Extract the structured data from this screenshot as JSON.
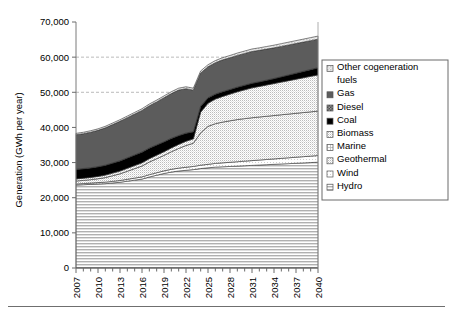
{
  "chart_data": {
    "type": "area",
    "stacked": true,
    "title": "",
    "xlabel": "",
    "ylabel": "Generation (GWh per year)",
    "ylim": [
      0,
      70000
    ],
    "ytick_labels": [
      "0",
      "10,000",
      "20,000",
      "30,000",
      "40,000",
      "50,000",
      "60,000",
      "70,000"
    ],
    "ytick_values": [
      0,
      10000,
      20000,
      30000,
      40000,
      50000,
      60000,
      70000
    ],
    "grid": "horizontal-dashed",
    "legend_position": "right",
    "x": [
      2007,
      2008,
      2009,
      2010,
      2011,
      2012,
      2013,
      2014,
      2015,
      2016,
      2017,
      2018,
      2019,
      2020,
      2021,
      2022,
      2023,
      2024,
      2025,
      2026,
      2027,
      2028,
      2029,
      2030,
      2031,
      2032,
      2033,
      2034,
      2035,
      2036,
      2037,
      2038,
      2039,
      2040
    ],
    "xtick_labels": [
      "2007",
      "2010",
      "2013",
      "2016",
      "2019",
      "2022",
      "2025",
      "2028",
      "2031",
      "2034",
      "2037",
      "2040"
    ],
    "xtick_values": [
      2007,
      2010,
      2013,
      2016,
      2019,
      2022,
      2025,
      2028,
      2031,
      2034,
      2037,
      2040
    ],
    "series": [
      {
        "name": "Hydro",
        "fill": "#d9d9d9",
        "pattern": "horizontal-lines",
        "values": [
          23600,
          23700,
          23800,
          23900,
          24000,
          24200,
          24400,
          24700,
          25000,
          25300,
          25900,
          26400,
          26900,
          27300,
          27600,
          27800,
          28000,
          28300,
          28500,
          28700,
          28800,
          28900,
          29000,
          29100,
          29200,
          29300,
          29400,
          29500,
          29600,
          29700,
          29800,
          29900,
          30000,
          30100
        ]
      },
      {
        "name": "Wind",
        "fill": "#f2f2f2",
        "pattern": "light-dots",
        "values": [
          300,
          330,
          360,
          400,
          430,
          460,
          500,
          540,
          580,
          620,
          660,
          700,
          740,
          780,
          820,
          860,
          900,
          950,
          1000,
          1060,
          1120,
          1180,
          1240,
          1300,
          1360,
          1420,
          1480,
          1540,
          1600,
          1660,
          1720,
          1780,
          1840,
          1900
        ]
      },
      {
        "name": "Geothermal",
        "fill": "#ebebeb",
        "pattern": "checker-dots",
        "values": [
          850,
          900,
          980,
          1100,
          1300,
          1600,
          1900,
          2300,
          2700,
          3100,
          3600,
          4000,
          4400,
          5000,
          5600,
          6200,
          6600,
          9200,
          10800,
          11300,
          11600,
          11800,
          12000,
          12100,
          12200,
          12250,
          12300,
          12350,
          12400,
          12450,
          12500,
          12550,
          12600,
          12650
        ]
      },
      {
        "name": "Marine",
        "fill": "#e0e0e0",
        "pattern": "fine-grid",
        "values": [
          0,
          0,
          0,
          0,
          0,
          0,
          0,
          0,
          0,
          0,
          0,
          0,
          0,
          0,
          0,
          0,
          0,
          0,
          0,
          0,
          0,
          0,
          0,
          0,
          0,
          0,
          0,
          0,
          0,
          0,
          0,
          0,
          0,
          0
        ]
      },
      {
        "name": "Biomass",
        "fill": "#e8e8e8",
        "pattern": "checker-dots",
        "values": [
          600,
          620,
          640,
          660,
          700,
          740,
          780,
          820,
          860,
          900,
          950,
          1000,
          1050,
          1100,
          1150,
          1200,
          1250,
          5900,
          6600,
          7000,
          7300,
          7600,
          7900,
          8200,
          8500,
          8700,
          8900,
          9100,
          9300,
          9500,
          9700,
          9900,
          10100,
          10300
        ]
      },
      {
        "name": "Coal",
        "fill": "#000000",
        "pattern": "solid",
        "values": [
          2700,
          2700,
          2700,
          2750,
          2800,
          2850,
          2900,
          2950,
          3000,
          3050,
          3000,
          2900,
          2800,
          2700,
          2500,
          2300,
          2000,
          1700,
          1500,
          1400,
          1350,
          1300,
          1300,
          1300,
          1300,
          1300,
          1350,
          1400,
          1500,
          1600,
          1700,
          1800,
          1900,
          2000
        ]
      },
      {
        "name": "Diesel",
        "fill": "#4d4d4d",
        "pattern": "coarse-checker",
        "values": [
          60,
          60,
          60,
          60,
          60,
          60,
          60,
          60,
          60,
          60,
          60,
          60,
          60,
          60,
          60,
          60,
          60,
          60,
          60,
          60,
          60,
          60,
          60,
          60,
          60,
          60,
          60,
          60,
          60,
          60,
          60,
          60,
          60,
          60
        ]
      },
      {
        "name": "Gas",
        "fill": "#595959",
        "pattern": "solid-dark",
        "values": [
          9800,
          9900,
          10100,
          10300,
          10600,
          10900,
          11200,
          11400,
          11600,
          11800,
          12000,
          12200,
          12500,
          12700,
          12900,
          12600,
          11800,
          9400,
          8800,
          8900,
          9000,
          9000,
          9000,
          9000,
          9000,
          8900,
          8800,
          8700,
          8600,
          8500,
          8400,
          8300,
          8200,
          8100
        ]
      },
      {
        "name": "Other cogeneration fuels",
        "fill": "#bfbfbf",
        "pattern": "light-checker",
        "values": [
          400,
          410,
          420,
          430,
          440,
          450,
          460,
          470,
          480,
          490,
          500,
          510,
          520,
          530,
          540,
          550,
          560,
          570,
          580,
          600,
          620,
          640,
          660,
          680,
          700,
          720,
          740,
          760,
          780,
          800,
          820,
          840,
          860,
          880
        ]
      }
    ],
    "legend_entries": [
      {
        "label": "Other cogeneration fuels",
        "swatch": "light-checker",
        "fill": "#bfbfbf"
      },
      {
        "label": "Gas",
        "swatch": "solid-dark",
        "fill": "#595959"
      },
      {
        "label": "Diesel",
        "swatch": "coarse-checker",
        "fill": "#4d4d4d"
      },
      {
        "label": "Coal",
        "swatch": "solid",
        "fill": "#000000"
      },
      {
        "label": "Biomass",
        "swatch": "checker-dots",
        "fill": "#e8e8e8"
      },
      {
        "label": "Marine",
        "swatch": "fine-grid",
        "fill": "#e0e0e0"
      },
      {
        "label": "Geothermal",
        "swatch": "checker-dots",
        "fill": "#ebebeb"
      },
      {
        "label": "Wind",
        "swatch": "light-dots",
        "fill": "#f2f2f2"
      },
      {
        "label": "Hydro",
        "swatch": "horizontal-lines",
        "fill": "#d9d9d9"
      }
    ]
  }
}
